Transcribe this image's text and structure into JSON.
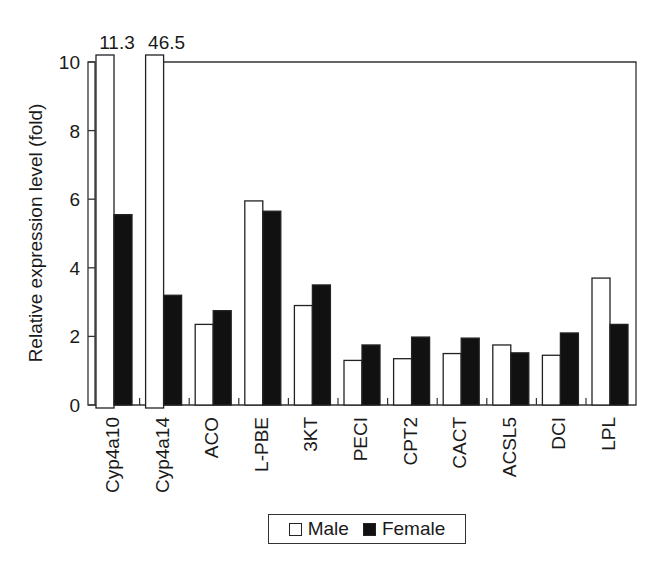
{
  "chart_data": {
    "type": "bar",
    "title": "",
    "xlabel": "",
    "ylabel": "Relative expression level (fold)",
    "ylim": [
      0,
      10
    ],
    "yticks": [
      0,
      2,
      4,
      6,
      8,
      10
    ],
    "grid": false,
    "legend_position": "bottom-center",
    "axis_break": true,
    "break_labels": [
      {
        "category": "Cyp4a10",
        "series": "Male",
        "label": "11.3"
      },
      {
        "category": "Cyp4a14",
        "series": "Male",
        "label": "46.5"
      }
    ],
    "categories": [
      "Cyp4a10",
      "Cyp4a14",
      "ACO",
      "L-PBE",
      "3KT",
      "PECI",
      "CPT2",
      "CACT",
      "ACSL5",
      "DCI",
      "LPL"
    ],
    "series": [
      {
        "name": "Male",
        "color": "#ffffff",
        "values": [
          11.3,
          46.5,
          2.35,
          5.95,
          2.9,
          1.3,
          1.35,
          1.5,
          1.75,
          1.45,
          3.7
        ]
      },
      {
        "name": "Female",
        "color": "#111111",
        "values": [
          5.55,
          3.2,
          2.75,
          5.65,
          3.5,
          1.75,
          1.98,
          1.95,
          1.52,
          2.1,
          2.35
        ]
      }
    ]
  },
  "legend": {
    "male_label": "Male",
    "female_label": "Female"
  }
}
